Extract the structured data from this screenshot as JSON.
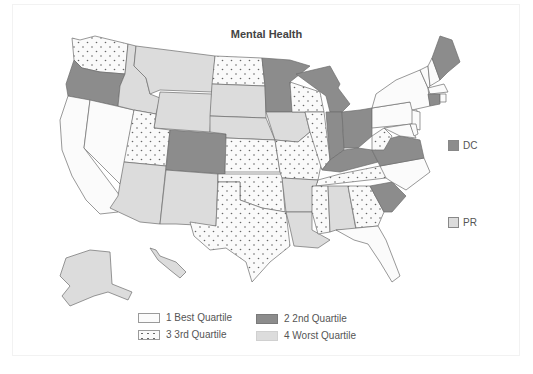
{
  "chart_data": {
    "type": "choropleth",
    "title": "Mental Health",
    "legend": [
      {
        "code": 1,
        "label": "1 Best Quartile",
        "fill": "#fbfbfb",
        "pattern": "none"
      },
      {
        "code": 2,
        "label": "2 2nd Quartile",
        "fill": "#8c8c8c",
        "pattern": "none"
      },
      {
        "code": 3,
        "label": "3 3rd Quartile",
        "fill": "#fafafa",
        "pattern": "dots"
      },
      {
        "code": 4,
        "label": "4 Worst Quartile",
        "fill": "#dcdcdc",
        "pattern": "none"
      }
    ],
    "legend_position": "bottom",
    "states": {
      "CA": 1,
      "NV": 1,
      "NY": 1,
      "PA": 1,
      "NJ": 1,
      "VT": 1,
      "NH": 1,
      "MA": 1,
      "RI": 1,
      "DE": 1,
      "MD": 1,
      "NC": 1,
      "FL": 1,
      "OR": 2,
      "CO": 2,
      "MN": 2,
      "MI": 2,
      "IN": 2,
      "OH": 2,
      "KY": 2,
      "VA": 2,
      "SC": 2,
      "CT": 2,
      "ME": 2,
      "DC": 2,
      "WA": 3,
      "UT": 3,
      "ND": 3,
      "WI": 3,
      "IL": 3,
      "KS": 3,
      "MO": 3,
      "OK": 3,
      "TX": 3,
      "MS": 3,
      "TN": 3,
      "GA": 3,
      "WV": 3,
      "ID": 4,
      "MT": 4,
      "WY": 4,
      "SD": 4,
      "NE": 4,
      "IA": 4,
      "AZ": 4,
      "NM": 4,
      "AR": 4,
      "LA": 4,
      "AL": 4,
      "AK": 4,
      "HI": 4,
      "PR": 4
    },
    "insets": [
      {
        "label": "DC",
        "quartile": 2
      },
      {
        "label": "PR",
        "quartile": 4
      }
    ]
  },
  "colors": {
    "q1": "#fbfbfb",
    "q2": "#8c8c8c",
    "q3": "#fafafa",
    "q4": "#dcdcdc",
    "border": "#6d6d6d",
    "text": "#555555"
  }
}
